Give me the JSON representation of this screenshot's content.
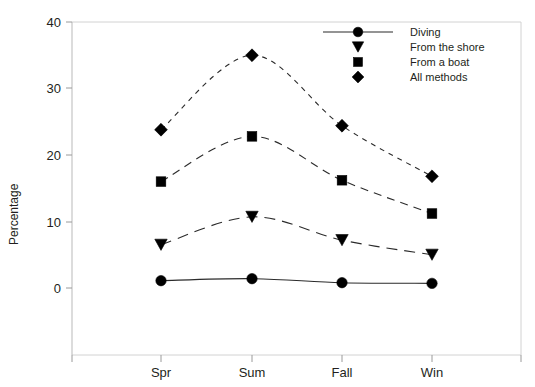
{
  "chart_data": {
    "type": "line",
    "title": "",
    "subtitle": "",
    "xlabel": "",
    "ylabel": "Percentage",
    "categories": [
      "Spr",
      "Sum",
      "Fall",
      "Win"
    ],
    "ylim": [
      0,
      40
    ],
    "yticks": [
      0,
      10,
      20,
      30,
      40
    ],
    "ytick_labels": [
      "0",
      "10",
      "20",
      "30",
      "40"
    ],
    "grid": false,
    "legend_position": "top-right",
    "series": [
      {
        "name": "Diving",
        "marker": "circle",
        "linestyle": "solid",
        "values": [
          1.1,
          1.4,
          0.8,
          0.7
        ]
      },
      {
        "name": "From the shore",
        "marker": "triangle-down",
        "linestyle": "long-dash",
        "values": [
          6.5,
          10.7,
          7.2,
          5.0
        ]
      },
      {
        "name": "From a boat",
        "marker": "square",
        "linestyle": "dash",
        "values": [
          16.0,
          22.8,
          16.2,
          11.2
        ]
      },
      {
        "name": "All methods",
        "marker": "diamond",
        "linestyle": "short-dash",
        "values": [
          23.8,
          35.0,
          24.4,
          16.8
        ]
      }
    ],
    "colors": {
      "marker": "#000000",
      "line": "#2b2b2b",
      "axis": "#b9b9b9",
      "text": "#231f20",
      "background": "#ffffff"
    }
  },
  "axis": {
    "y_title": "Percentage",
    "y_tick_0": "0",
    "y_tick_10": "10",
    "y_tick_20": "20",
    "y_tick_30": "30",
    "y_tick_40": "40",
    "x_tick_1": "Spr",
    "x_tick_2": "Sum",
    "x_tick_3": "Fall",
    "x_tick_4": "Win"
  },
  "legend": {
    "entry_1": "Diving",
    "entry_2": "From the shore",
    "entry_3": "From a boat",
    "entry_4": "All methods"
  }
}
